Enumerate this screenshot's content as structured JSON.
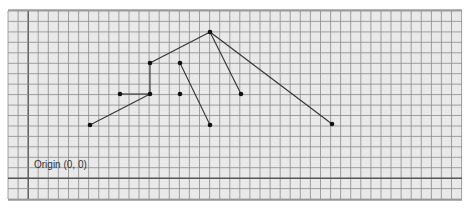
{
  "diagram": {
    "type": "tree-on-graph-paper",
    "origin_label": "Origin (0, 0)",
    "colors": {
      "paper": "#e9e9e9",
      "grid_line": "#8a8a8a",
      "grid_major": "#555555",
      "edge": "#333333",
      "node": "#111111"
    },
    "grid": {
      "left": 8,
      "top": 11,
      "right": 462,
      "bottom": 199,
      "spacing_x": 10.08,
      "spacing_y": 10.45,
      "major_x": [
        30
      ],
      "major_y": [
        177
      ]
    },
    "nodes": [
      {
        "id": "root",
        "x": 210,
        "y": 32
      },
      {
        "id": "a",
        "x": 150,
        "y": 63
      },
      {
        "id": "b",
        "x": 180,
        "y": 63
      },
      {
        "id": "c",
        "x": 120,
        "y": 94
      },
      {
        "id": "d",
        "x": 150,
        "y": 94
      },
      {
        "id": "e",
        "x": 180,
        "y": 94
      },
      {
        "id": "g",
        "x": 241,
        "y": 94
      },
      {
        "id": "f",
        "x": 90,
        "y": 125
      },
      {
        "id": "h",
        "x": 210,
        "y": 125
      },
      {
        "id": "i",
        "x": 332,
        "y": 124
      }
    ],
    "edges": [
      [
        "root",
        "a"
      ],
      [
        "root",
        "g"
      ],
      [
        "root",
        "i"
      ],
      [
        "a",
        "d"
      ],
      [
        "c",
        "d"
      ],
      [
        "d",
        "f"
      ],
      [
        "b",
        "h"
      ]
    ]
  }
}
